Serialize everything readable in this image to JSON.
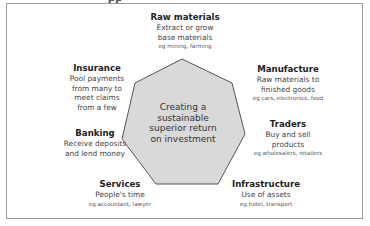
{
  "header": {
    "cut_text": "pp"
  },
  "center": {
    "lines": [
      "Creating a",
      "sustainable",
      "superior return",
      "on investment"
    ]
  },
  "nodes": {
    "raw_materials": {
      "title": "Raw materials",
      "desc": [
        "Extract or grow",
        "base materials"
      ],
      "eg": "eg mining, farming"
    },
    "manufacture": {
      "title": "Manufacture",
      "desc": [
        "Raw materials to",
        "finished goods"
      ],
      "eg": "eg cars, electronics, food"
    },
    "traders": {
      "title": "Traders",
      "desc": [
        "Buy and sell",
        "products"
      ],
      "eg": "eg wholesalers, retailers"
    },
    "infrastructure": {
      "title": "Infrastructure",
      "desc": [
        "Use of assets"
      ],
      "eg": "eg hotel, transport"
    },
    "services": {
      "title": "Services",
      "desc": [
        "People's time"
      ],
      "eg": "eg accountant, lawyer"
    },
    "banking": {
      "title": "Banking",
      "desc": [
        "Receive deposits",
        "and lend money"
      ]
    },
    "insurance": {
      "title": "Insurance",
      "desc": [
        "Pool payments",
        "from many to",
        "meet claims",
        "from a few"
      ]
    }
  },
  "colors": {
    "heptagon_fill": "#d9d9d9",
    "heptagon_stroke": "#555555",
    "frame": "#9a9a9a"
  }
}
